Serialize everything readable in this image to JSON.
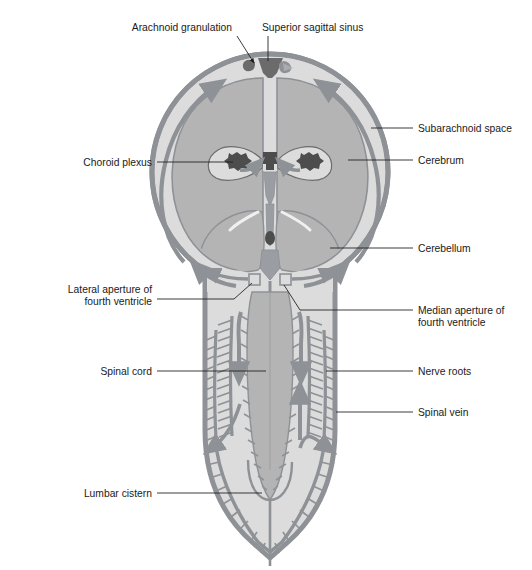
{
  "figure": {
    "type": "anatomical-diagram",
    "width": 532,
    "height": 570
  },
  "colors": {
    "background": "#ffffff",
    "text": "#1a1a1a",
    "leader_line": "#1a1a1a",
    "dura_outer": "#8e9296",
    "subarachnoid_space": "#dcdcdc",
    "brain_tissue": "#b4b4b4",
    "ventricle_fill": "#f0f0f0",
    "csf_flow_arrow": "#8e9296",
    "choroid_plexus": "#595959",
    "sagittal_sinus": "#6b6b6b",
    "nerve_root": "#8e9296",
    "lumbar_cistern_fill": "#dcdcdc"
  },
  "labels": {
    "top": [
      {
        "id": "arachnoid-granulation",
        "text": "Arachnoid granulation",
        "side": "top-left",
        "text_x": 232,
        "text_y": 31,
        "anchor": "end",
        "leader": "M236,35 L253,62"
      },
      {
        "id": "superior-sagittal-sinus",
        "text": "Superior sagittal sinus",
        "side": "top-right",
        "text_x": 262,
        "text_y": 31,
        "anchor": "start",
        "leader": "M268,35 L268,60"
      }
    ],
    "left": [
      {
        "id": "choroid-plexus",
        "text": "Choroid plexus",
        "text_x": 152,
        "text_y": 165,
        "leader": "M158,162 L232,162"
      },
      {
        "id": "lateral-aperture-fourth-ventricle",
        "text": "Lateral aperture of\nfourth ventricle",
        "line1": "Lateral aperture of",
        "line2": "fourth ventricle",
        "text_x": 152,
        "text_y": 292,
        "leader": "M158,299 L232,299 L252,282"
      },
      {
        "id": "spinal-cord",
        "text": "Spinal cord",
        "text_x": 152,
        "text_y": 374,
        "leader": "M158,371 L266,371"
      },
      {
        "id": "lumbar-cistern",
        "text": "Lumbar cistern",
        "text_x": 152,
        "text_y": 496,
        "leader": "M158,493 L262,493"
      }
    ],
    "right": [
      {
        "id": "subarachnoid-space",
        "text": "Subarachnoid space",
        "text_x": 418,
        "text_y": 131,
        "leader": "M370,128 L412,128"
      },
      {
        "id": "cerebrum",
        "text": "Cerebrum",
        "text_x": 418,
        "text_y": 163,
        "leader": "M348,160 L412,160"
      },
      {
        "id": "cerebellum",
        "text": "Cerebellum",
        "text_x": 418,
        "text_y": 251,
        "leader": "M330,248 L412,248"
      },
      {
        "id": "median-aperture-fourth-ventricle",
        "text": "Median aperture of\nfourth ventricle",
        "line1": "Median aperture of",
        "line2": "fourth ventricle",
        "text_x": 418,
        "text_y": 313,
        "leader": "M300,310 L412,310 M300,310 L282,284"
      },
      {
        "id": "nerve-roots",
        "text": "Nerve roots",
        "text_x": 418,
        "text_y": 374,
        "leader": "M324,371 L412,371"
      },
      {
        "id": "spinal-vein",
        "text": "Spinal vein",
        "text_x": 418,
        "text_y": 415,
        "leader": "M334,412 L412,412"
      }
    ]
  },
  "structures": [
    {
      "id": "skull-dura",
      "name": "Dura mater / skull outline"
    },
    {
      "id": "subarachnoid-space-region",
      "name": "Subarachnoid space"
    },
    {
      "id": "cerebral-hemispheres",
      "name": "Cerebral hemispheres"
    },
    {
      "id": "lateral-ventricles",
      "name": "Lateral ventricles"
    },
    {
      "id": "third-ventricle",
      "name": "Third ventricle"
    },
    {
      "id": "fourth-ventricle",
      "name": "Fourth ventricle"
    },
    {
      "id": "cerebellum-region",
      "name": "Cerebellum"
    },
    {
      "id": "spinal-cord-region",
      "name": "Spinal cord"
    },
    {
      "id": "cauda-equina",
      "name": "Cauda equina / nerve roots"
    },
    {
      "id": "lumbar-cistern-region",
      "name": "Lumbar cistern"
    },
    {
      "id": "csf-flow-arrows",
      "name": "CSF flow direction arrows"
    }
  ]
}
